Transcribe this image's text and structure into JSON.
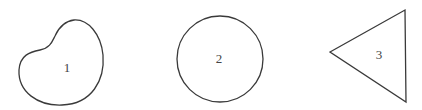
{
  "diagram": {
    "shapes": [
      {
        "id": 1,
        "label": "1",
        "kind": "irregular-blob"
      },
      {
        "id": 2,
        "label": "2",
        "kind": "circle"
      },
      {
        "id": 3,
        "label": "3",
        "kind": "triangle"
      }
    ],
    "colors": {
      "stroke": "#3a3a3a",
      "text": "#444444",
      "background": "#ffffff"
    }
  }
}
